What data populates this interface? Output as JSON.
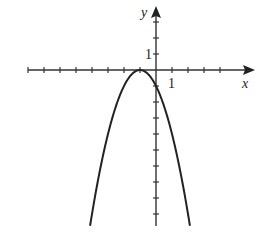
{
  "chart_data": {
    "type": "line",
    "title": "",
    "function": "y = -(x + 1)^2",
    "xlabel": "x",
    "ylabel": "y",
    "xlim": [
      -8,
      6
    ],
    "ylim": [
      -9.75,
      3.5
    ],
    "grid": false,
    "legend": null,
    "x_tick_step": 1,
    "y_tick_step": 1,
    "tick_labels": {
      "x": [
        "1"
      ],
      "y": [
        "1"
      ]
    },
    "vertex": [
      -1,
      0
    ],
    "y_intercept": [
      0,
      -1
    ],
    "series": [
      {
        "name": "parabola",
        "x": [
          -4.12,
          -4,
          -3,
          -2,
          -1.5,
          -1,
          -0.5,
          0,
          1,
          2,
          2.12
        ],
        "y": [
          -9.75,
          -9,
          -4,
          -1,
          -0.25,
          0,
          -0.25,
          -1,
          -4,
          -9,
          -9.75
        ]
      }
    ],
    "colors": {
      "axis": "#333333",
      "curve": "#222222",
      "background": "#ffffff"
    }
  }
}
